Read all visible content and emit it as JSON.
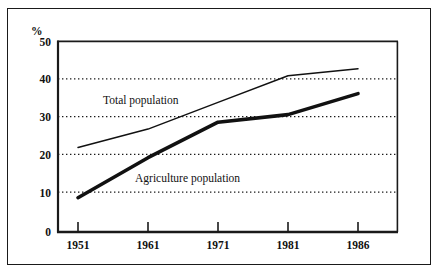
{
  "chart_data": {
    "type": "line",
    "title": "",
    "subtitle": "",
    "xlabel": "",
    "ylabel": "%",
    "ylim": [
      0,
      50
    ],
    "yticks": [
      0,
      10,
      20,
      30,
      40,
      50
    ],
    "ytick_labels": [
      "0",
      "10",
      "20",
      "30",
      "40",
      "50"
    ],
    "categories": [
      "1951",
      "1961",
      "1971",
      "1981",
      "1986"
    ],
    "x": [
      1951,
      1961,
      1971,
      1981,
      1986
    ],
    "grid": "horizontal-dotted",
    "legend_position": "inline-annotation",
    "series": [
      {
        "name": "Total population",
        "values": [
          22.2,
          27.0,
          34.0,
          41.0,
          42.8
        ],
        "line_width": "thin",
        "color": "#111111"
      },
      {
        "name": "Agriculture population",
        "values": [
          9.0,
          19.5,
          28.8,
          30.8,
          36.3
        ],
        "line_width": "thick",
        "color": "#111111"
      }
    ],
    "annotations": [
      {
        "text": "Total population",
        "series": "Total population"
      },
      {
        "text": "Agriculture population",
        "series": "Agriculture population"
      }
    ]
  },
  "axes": {
    "y_unit_label": "%",
    "y_ticks": [
      "50",
      "40",
      "30",
      "20",
      "10",
      "0"
    ],
    "x_ticks": [
      "1951",
      "1961",
      "1971",
      "1981",
      "1986"
    ]
  },
  "labels": {
    "total_population": "Total population",
    "agriculture_population": "Agriculture population"
  },
  "colors": {
    "line": "#111111",
    "grid": "#1a1a1a",
    "frame": "#1a1a1a",
    "background": "#ffffff"
  }
}
